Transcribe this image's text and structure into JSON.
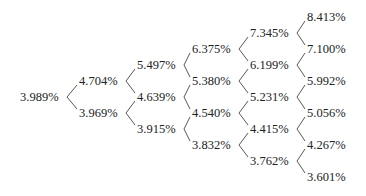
{
  "tree": {
    "periods": [
      [
        "3.989%"
      ],
      [
        "4.704%",
        "3.969%"
      ],
      [
        "5.497%",
        "4.639%",
        "3.915%"
      ],
      [
        "6.375%",
        "5.380%",
        "4.540%",
        "3.832%"
      ],
      [
        "7.345%",
        "6.199%",
        "5.231%",
        "4.415%",
        "3.762%"
      ],
      [
        "8.413%",
        "7.100%",
        "5.992%",
        "5.056%",
        "4.267%",
        "3.601%"
      ]
    ]
  }
}
